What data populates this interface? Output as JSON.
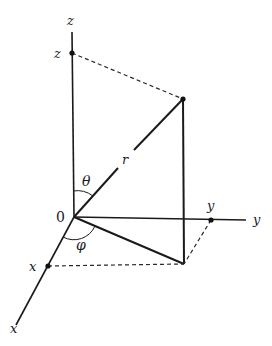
{
  "diagram": {
    "labels": {
      "z_axis": "z",
      "z_point": "z",
      "y_axis": "y",
      "y_point": "y",
      "x_axis": "x",
      "x_point": "x",
      "origin": "0",
      "radius": "r",
      "theta": "θ",
      "phi": "φ"
    },
    "points": {
      "origin": [
        74,
        217
      ],
      "P": [
        183,
        99
      ],
      "P_projection": [
        184,
        264
      ],
      "z_marker": [
        72,
        53
      ],
      "y_marker": [
        211,
        220
      ],
      "x_marker": [
        48,
        266
      ]
    },
    "colors": {
      "ink": "#1a1a1a",
      "background": "#ffffff"
    }
  }
}
